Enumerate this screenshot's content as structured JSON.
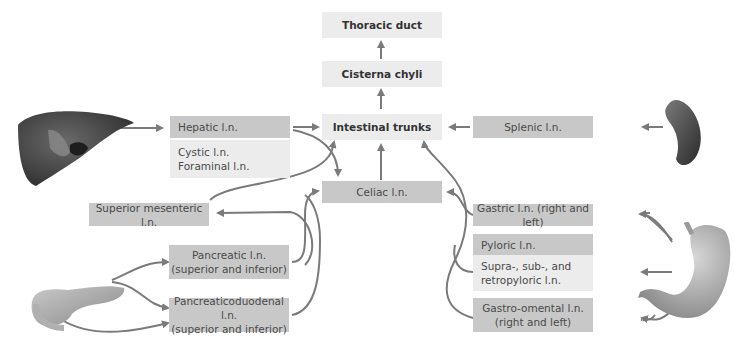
{
  "diagram": {
    "title_nodes": {
      "thoracic_duct": "Thoracic duct",
      "cisterna_chyli": "Cisterna chyli",
      "intestinal_trunks": "Intestinal trunks"
    },
    "nodes": {
      "hepatic": "Hepatic l.n.",
      "cystic": "Cystic l.n.",
      "foraminal": "Foraminal l.n.",
      "splenic": "Splenic l.n.",
      "celiac": "Celiac l.n.",
      "superior_mesenteric": "Superior mesenteric l.n.",
      "pancreatic_line1": "Pancreatic l.n.",
      "pancreatic_line2": "(superior and inferior)",
      "pancreaticoduodenal_line1": "Pancreaticoduodenal l.n.",
      "pancreaticoduodenal_line2": "(superior and inferior)",
      "gastric": "Gastric l.n. (right and left)",
      "pyloric": "Pyloric l.n.",
      "suprapyloric_line1": "Supra-, sub-, and",
      "suprapyloric_line2": "retropyloric l.n.",
      "gastroomental_line1": "Gastro-omental l.n.",
      "gastroomental_line2": "(right and left)"
    },
    "organs": [
      "liver-icon",
      "spleen-icon",
      "pancreas-icon",
      "stomach-icon"
    ],
    "colors": {
      "dark_box": "#c8c8c8",
      "light_box": "#ececec",
      "arrow": "#7a7a7a"
    }
  }
}
